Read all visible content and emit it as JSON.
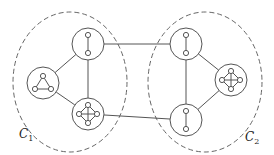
{
  "diagram": {
    "type": "hierarchical-graph",
    "colors": {
      "stroke": "#555555",
      "dashed": "#666666",
      "background": "#ffffff"
    },
    "clusters": [
      {
        "id": "C1",
        "label": "C",
        "subscript": "1",
        "cx": 70,
        "cy": 82,
        "rx": 57,
        "ry": 70,
        "label_x": 19,
        "label_y": 128
      },
      {
        "id": "C2",
        "label": "C",
        "subscript": "2",
        "cx": 205,
        "cy": 82,
        "rx": 57,
        "ry": 70,
        "label_x": 245,
        "label_y": 131
      }
    ],
    "supernodes": [
      {
        "id": "L-top",
        "cluster": "C1",
        "cx": 88,
        "cy": 44,
        "r": 16,
        "inner": "edge"
      },
      {
        "id": "L-tri",
        "cluster": "C1",
        "cx": 43,
        "cy": 83,
        "r": 16,
        "inner": "triangle"
      },
      {
        "id": "L-k4",
        "cluster": "C1",
        "cx": 88,
        "cy": 114,
        "r": 16,
        "inner": "k4"
      },
      {
        "id": "R-top",
        "cluster": "C2",
        "cx": 186,
        "cy": 44,
        "r": 16,
        "inner": "edge"
      },
      {
        "id": "R-k4",
        "cluster": "C2",
        "cx": 231,
        "cy": 80,
        "r": 16,
        "inner": "k4"
      },
      {
        "id": "R-bot",
        "cluster": "C2",
        "cx": 186,
        "cy": 120,
        "r": 16,
        "inner": "edge"
      }
    ],
    "edges": [
      [
        "L-top",
        "L-tri"
      ],
      [
        "L-top",
        "L-k4"
      ],
      [
        "L-tri",
        "L-k4"
      ],
      [
        "R-top",
        "R-k4"
      ],
      [
        "R-top",
        "R-bot"
      ],
      [
        "R-k4",
        "R-bot"
      ],
      [
        "L-top",
        "R-top"
      ],
      [
        "L-k4",
        "R-bot"
      ]
    ]
  }
}
